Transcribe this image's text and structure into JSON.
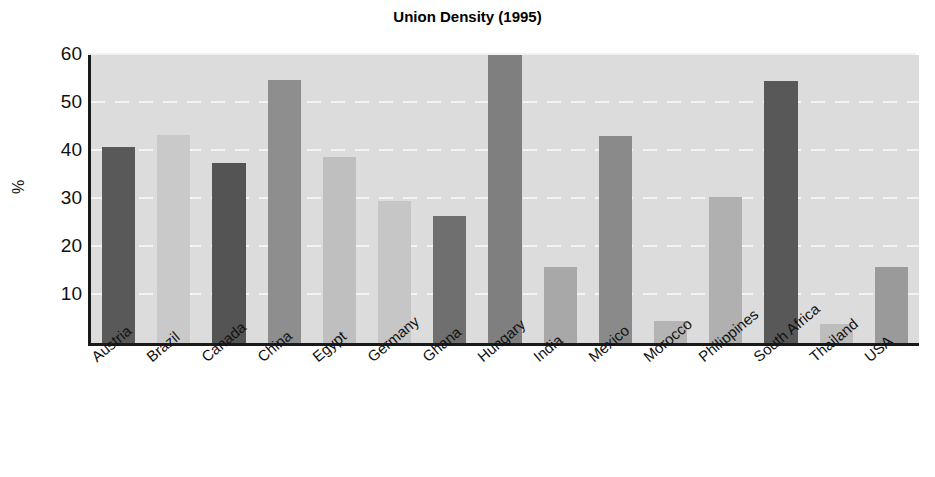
{
  "chart_data": {
    "type": "bar",
    "title": "Union Density (1995)",
    "xlabel": "",
    "ylabel": "%",
    "ylim": [
      0,
      60
    ],
    "yticks": [
      10,
      20,
      30,
      40,
      50,
      60
    ],
    "grid": true,
    "legend": "none",
    "categories": [
      "Austria",
      "Brazil",
      "Canada",
      "China",
      "Egypt",
      "Germany",
      "Ghana",
      "Hungary",
      "India",
      "Mexico",
      "Morocco",
      "Philippines",
      "South Africa",
      "Thailand",
      "USA"
    ],
    "values": [
      40.8,
      43.3,
      37.5,
      54.8,
      38.8,
      29.6,
      26.4,
      60.0,
      15.8,
      43.2,
      4.5,
      30.4,
      54.5,
      4.0,
      15.8
    ],
    "bar_colors": [
      "#595959",
      "#c9c9c9",
      "#545454",
      "#8e8e8e",
      "#bfbfbf",
      "#c6c6c6",
      "#6f6f6f",
      "#7f7f7f",
      "#a8a8a8",
      "#8a8a8a",
      "#b4b4b4",
      "#b0b0b0",
      "#585858",
      "#bdbdbd",
      "#9a9a9a"
    ],
    "plot_background": "#dcdcdc",
    "gridline_color": "#f4f4f4",
    "axis_color": "#1a1a1a",
    "text_color": "#111111"
  }
}
